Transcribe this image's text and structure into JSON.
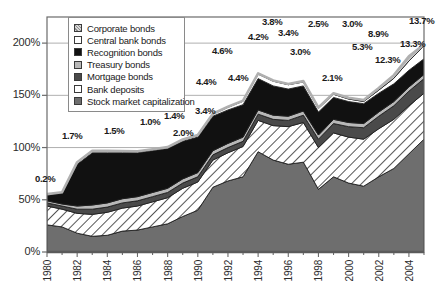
{
  "chart_data": {
    "type": "area",
    "title": "",
    "xlabel": "",
    "ylabel": "",
    "ylim": [
      0,
      225
    ],
    "yticks": [
      "0%",
      "50%",
      "100%",
      "150%",
      "200%"
    ],
    "ytick_values": [
      0,
      50,
      100,
      150,
      200
    ],
    "grid": true,
    "legend_position": "top-left-inside",
    "x": [
      1980,
      1981,
      1982,
      1983,
      1984,
      1985,
      1986,
      1987,
      1988,
      1989,
      1990,
      1991,
      1992,
      1993,
      1994,
      1995,
      1996,
      1997,
      1998,
      1999,
      2000,
      2001,
      2002,
      2003,
      2004,
      2005
    ],
    "xticks": [
      "1980",
      "1982",
      "1984",
      "1986",
      "1988",
      "1990",
      "1992",
      "1994",
      "1996",
      "1998",
      "2000",
      "2002",
      "2004"
    ],
    "stack_order_bottom_to_top": [
      "Stock market capitalization",
      "Bank deposits",
      "Mortgage bonds",
      "Treasury bonds",
      "Recognition bonds",
      "Central bank bonds",
      "Corporate bonds"
    ],
    "series": [
      {
        "name": "Stock market capitalization",
        "pattern": "solid-gray",
        "color": "#6e6e6e",
        "values": [
          26,
          24,
          18,
          15,
          16,
          20,
          21,
          24,
          27,
          34,
          40,
          62,
          68,
          72,
          96,
          88,
          84,
          86,
          60,
          72,
          66,
          63,
          72,
          80,
          94,
          108
        ]
      },
      {
        "name": "Bank deposits",
        "pattern": "diagonal-hatch-white",
        "color": "#ffffff",
        "values": [
          18,
          17,
          19,
          21,
          22,
          22,
          23,
          24,
          25,
          27,
          27,
          26,
          27,
          29,
          30,
          33,
          36,
          38,
          40,
          42,
          44,
          45,
          46,
          47,
          46,
          44
        ]
      },
      {
        "name": "Mortgage bonds",
        "pattern": "solid-darkgray",
        "color": "#4a4a4a",
        "values": [
          3,
          3,
          4,
          5,
          5,
          5,
          5,
          5,
          5,
          5,
          5,
          5,
          5,
          5,
          6,
          6,
          6,
          7,
          8,
          9,
          10,
          11,
          12,
          13,
          14,
          14
        ]
      },
      {
        "name": "Treasury bonds",
        "pattern": "solid-lightgray",
        "color": "#b8b8b8",
        "values": [
          2,
          2,
          3,
          4,
          4,
          4,
          4,
          4,
          4,
          4,
          4,
          4,
          4,
          4,
          4,
          4,
          4,
          4,
          4,
          4,
          4,
          4,
          4,
          4,
          4,
          4
        ]
      },
      {
        "name": "Recognition bonds",
        "pattern": "solid-black",
        "color": "#111111",
        "values": [
          6,
          10,
          40,
          50,
          48,
          44,
          42,
          40,
          38,
          36,
          34,
          33,
          32,
          31,
          30,
          28,
          26,
          24,
          22,
          21,
          20,
          19,
          18,
          17,
          16,
          15
        ]
      },
      {
        "name": "Central bank bonds",
        "pattern": "solid-white",
        "color": "#ffffff",
        "values": [
          0.2,
          1.0,
          1.7,
          1.6,
          1.5,
          1.4,
          1.2,
          1.0,
          1.1,
          1.4,
          1.6,
          2.0,
          2.6,
          3.4,
          4.4,
          4.6,
          4.2,
          3.8,
          3.4,
          3.0,
          2.5,
          2.1,
          3.0,
          5.3,
          8.9,
          12.3
        ]
      },
      {
        "name": "Corporate bonds",
        "pattern": "diagonal-hatch-lightgray",
        "color": "#d2d2d2",
        "values": [
          0.2,
          0.2,
          0.3,
          0.3,
          0.3,
          0.3,
          0.3,
          0.3,
          0.3,
          0.3,
          0.4,
          0.4,
          0.5,
          0.5,
          0.6,
          0.6,
          0.7,
          0.8,
          0.9,
          1.0,
          1.2,
          1.5,
          2.0,
          3.0,
          4.4,
          1.4
        ]
      }
    ],
    "data_labels": [
      {
        "text": "0.2%",
        "x": 1980,
        "px": 35,
        "py": 173
      },
      {
        "text": "1.7%",
        "x": 1982,
        "px": 62,
        "py": 130
      },
      {
        "text": "1.5%",
        "x": 1984,
        "px": 104,
        "py": 125
      },
      {
        "text": "1.0%",
        "x": 1986,
        "px": 140,
        "py": 116
      },
      {
        "text": "1.4%",
        "x": 1987,
        "px": 164,
        "py": 110
      },
      {
        "text": "2.0%",
        "x": 1988,
        "px": 173,
        "py": 127
      },
      {
        "text": "3.4%",
        "x": 1990,
        "px": 195,
        "py": 105
      },
      {
        "text": "4.4%",
        "x": 1991,
        "px": 196,
        "py": 76
      },
      {
        "text": "4.4%",
        "x": 1993,
        "px": 228,
        "py": 72
      },
      {
        "text": "4.6%",
        "x": 1992,
        "px": 212,
        "py": 45
      },
      {
        "text": "4.2%",
        "x": 1994,
        "px": 248,
        "py": 31
      },
      {
        "text": "3.8%",
        "x": 1995,
        "px": 262,
        "py": 16
      },
      {
        "text": "3.4%",
        "x": 1996,
        "px": 278,
        "py": 27
      },
      {
        "text": "3.0%",
        "x": 1997,
        "px": 290,
        "py": 46
      },
      {
        "text": "2.5%",
        "x": 1998,
        "px": 308,
        "py": 18
      },
      {
        "text": "2.1%",
        "x": 1999,
        "px": 322,
        "py": 72
      },
      {
        "text": "3.0%",
        "x": 2000,
        "px": 342,
        "py": 18
      },
      {
        "text": "5.3%",
        "x": 2001,
        "px": 352,
        "py": 41
      },
      {
        "text": "8.9%",
        "x": 2002,
        "px": 368,
        "py": 28
      },
      {
        "text": "12.3%",
        "x": 2003,
        "px": 375,
        "py": 54
      },
      {
        "text": "13.3%",
        "x": 2004,
        "px": 400,
        "py": 38
      },
      {
        "text": "13.7%",
        "x": 2005,
        "px": 409,
        "py": 15
      }
    ]
  },
  "legend": {
    "items": [
      {
        "label": "Corporate bonds",
        "swatch": "hatch-light"
      },
      {
        "label": "Central bank bonds",
        "swatch": "white"
      },
      {
        "label": "Recognition bonds",
        "swatch": "black"
      },
      {
        "label": "Treasury bonds",
        "swatch": "lightgray"
      },
      {
        "label": "Mortgage bonds",
        "swatch": "darkgray"
      },
      {
        "label": "Bank deposits",
        "swatch": "white"
      },
      {
        "label": "Stock market capitalization",
        "swatch": "midgray"
      }
    ]
  },
  "colors": {
    "stock_market": "#6e6e6e",
    "bank_deposits": "#ffffff",
    "mortgage": "#4a4a4a",
    "treasury": "#b8b8b8",
    "recognition": "#111111",
    "central_bank": "#ffffff",
    "corporate": "#d2d2d2",
    "axis": "#6b6b6b",
    "grid": "#9a9a9a",
    "text": "#1a1a1a"
  }
}
